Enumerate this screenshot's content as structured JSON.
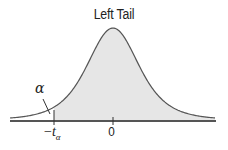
{
  "title": "Left Tail",
  "labels": {
    "alpha": "α",
    "critical_value_sign": "−",
    "critical_value_var": "t",
    "critical_value_sub": "α",
    "center": "0"
  },
  "colors": {
    "curve": "#555555",
    "shade": "#e6e6e6",
    "axis": "#555555",
    "text": "#222222"
  },
  "chart_data": {
    "type": "area",
    "title": "Left Tail",
    "x_ticks": [
      "−tα",
      "0"
    ],
    "annotations": [
      "α"
    ],
    "xlabel": "",
    "ylabel": "",
    "grid": false
  }
}
